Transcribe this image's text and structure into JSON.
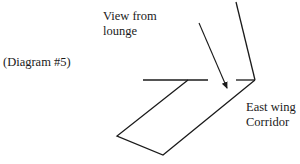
{
  "diagram": {
    "caption": "(Diagram #5)",
    "labels": {
      "view_line1": "View from",
      "view_line2": "lounge",
      "east_line1": "East wing",
      "east_line2": "Corridor"
    },
    "colors": {
      "stroke": "#1a1a1a",
      "background": "#ffffff"
    },
    "elements": [
      {
        "type": "line",
        "name": "corridor-top-left-wall",
        "from": [
          143,
          80
        ],
        "to": [
          208,
          80
        ]
      },
      {
        "type": "line",
        "name": "corridor-top-right-wall",
        "from": [
          236,
          80
        ],
        "to": [
          255,
          80
        ]
      },
      {
        "type": "line",
        "name": "north-wall",
        "from": [
          236,
          2
        ],
        "to": [
          255,
          80
        ]
      },
      {
        "type": "arrow",
        "name": "view-from-lounge-arrow",
        "from": [
          199,
          23
        ],
        "to": [
          227,
          89
        ]
      },
      {
        "type": "polyline",
        "name": "east-wing-corridor-outline",
        "points": [
          [
            188,
            80
          ],
          [
            117,
            136
          ],
          [
            163,
            155
          ],
          [
            255,
            80
          ]
        ]
      }
    ]
  }
}
